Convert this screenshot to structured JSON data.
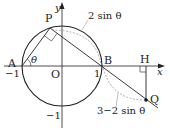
{
  "labels": {
    "P": "P",
    "A": "A",
    "B": "B",
    "O": "O",
    "H": "H",
    "Q": "Q",
    "x_axis": "x",
    "y_axis": "y",
    "theta": "θ",
    "neg1_x": "−1",
    "pos1_x": "1",
    "neg1_y": "−1",
    "arc_PB": "2 sin θ",
    "arc_BQ": "3−2 sin θ"
  },
  "colors": {
    "line": "#222222",
    "dashed": "#999999"
  }
}
